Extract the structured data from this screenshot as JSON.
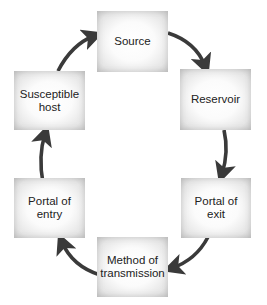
{
  "diagram": {
    "type": "cycle",
    "title": "",
    "colors": {
      "arrow": "#3a3a3a",
      "text": "#222222",
      "box_center": "#ffffff",
      "box_edge": "#cdcdcd",
      "background": "#ffffff"
    },
    "nodes": [
      {
        "id": "source",
        "label": "Source"
      },
      {
        "id": "reservoir",
        "label": "Reservoir"
      },
      {
        "id": "portal-of-exit",
        "label": "Portal of\nexit"
      },
      {
        "id": "method-of-transmission",
        "label": "Method of\ntransmission"
      },
      {
        "id": "portal-of-entry",
        "label": "Portal of\nentry"
      },
      {
        "id": "susceptible-host",
        "label": "Susceptible\nhost"
      }
    ],
    "edges": [
      {
        "from": "source",
        "to": "reservoir"
      },
      {
        "from": "reservoir",
        "to": "portal-of-exit"
      },
      {
        "from": "portal-of-exit",
        "to": "method-of-transmission"
      },
      {
        "from": "method-of-transmission",
        "to": "portal-of-entry"
      },
      {
        "from": "portal-of-entry",
        "to": "susceptible-host"
      },
      {
        "from": "susceptible-host",
        "to": "source"
      }
    ]
  }
}
